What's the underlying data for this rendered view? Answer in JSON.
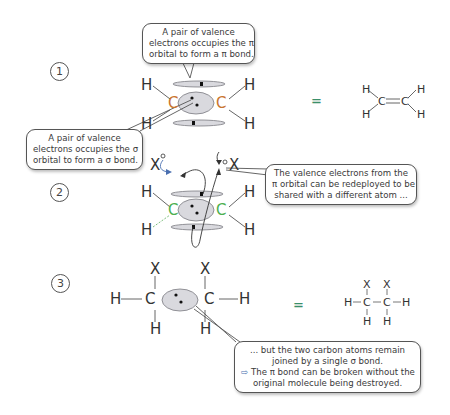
{
  "steps": [
    {
      "number": "1",
      "callouts": {
        "pi_bond": [
          "A pair of valence",
          "electrons occupies the π",
          "orbital to form a π bond."
        ],
        "sigma_bond": [
          "A pair of valence",
          "electrons occupies the σ",
          "orbital to form a σ bond."
        ]
      },
      "atoms": {
        "carbon": "C",
        "hydrogen": "H"
      },
      "equals": "=",
      "structural_formula": {
        "description": "ethene H2C=CH2",
        "carbon": "C",
        "hydrogen": "H",
        "bond": "="
      }
    },
    {
      "number": "2",
      "callouts": {
        "redeploy": [
          "The valence electrons from the",
          "π orbital can be redeployed to be",
          "shared with a different atom ..."
        ]
      },
      "atoms": {
        "carbon": "C",
        "hydrogen": "H",
        "substituent": "X"
      }
    },
    {
      "number": "3",
      "callouts": {
        "sigma_remains": [
          "... but the two carbon atoms remain",
          "joined by a single σ bond.",
          "The π bond can be broken without the",
          "original molecule being destroyed."
        ],
        "implication_arrow": "⇨"
      },
      "atoms": {
        "carbon": "C",
        "hydrogen": "H",
        "substituent": "X"
      },
      "equals": "=",
      "structural_formula": {
        "description": "HXC-CXH... H-C(X)(H)-C(X)(H)-H",
        "carbon": "C",
        "hydrogen": "H",
        "substituent": "X"
      }
    }
  ],
  "colors": {
    "orbital_fill": "#d9d9de",
    "orbital_stroke": "#7a7a80",
    "carbon_step1": "#c9742e",
    "carbon_step2": "#4caf50",
    "equals": "#3b8f6a",
    "text": "#333333",
    "callout_border": "#555555"
  }
}
